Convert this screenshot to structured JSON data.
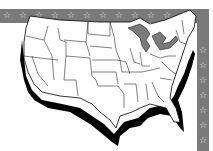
{
  "map": {
    "subject": "United States (contiguous) outline map with state borders",
    "colors": {
      "background": "#ffffff",
      "border_band": "#7a7a7a",
      "border_stars": "#e8e8e8",
      "land_fill": "#ffffff",
      "state_lines": "#000000",
      "coast_shadow": "#000000",
      "great_lakes": "#7a7a7a"
    },
    "border": {
      "top_star_count": 12,
      "right_star_count": 7,
      "star_glyph": "star-icon"
    }
  }
}
